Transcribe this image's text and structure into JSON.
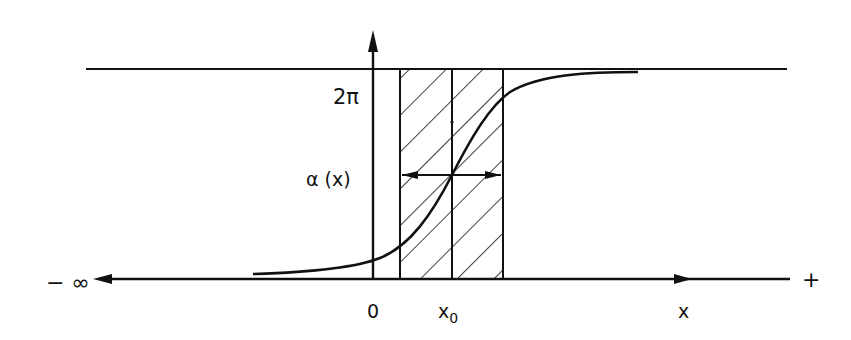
{
  "diagram": {
    "type": "phase-profile-sketch",
    "colors": {
      "ink": "#111111",
      "background": "#ffffff"
    },
    "labels": {
      "upper_level": "2π",
      "function": "α (x)",
      "origin": "0",
      "center": "x",
      "center_sub": "0",
      "axis": "x",
      "left_end": "− ∞",
      "right_end": "+"
    },
    "elements": {
      "vertical_axis": "arrow pointing up at x=0",
      "horizontal_axis": "double-headed line from −∞ to +, with arrow mark pointing right",
      "upper_line": "horizontal line at level 2π",
      "hatched_band": "diagonally hatched region around x0, split by a center line",
      "width_arrow": "double-headed horizontal arrow across the band at mid-height",
      "curve": "sigmoid α(x) from 0 to 2π"
    }
  }
}
